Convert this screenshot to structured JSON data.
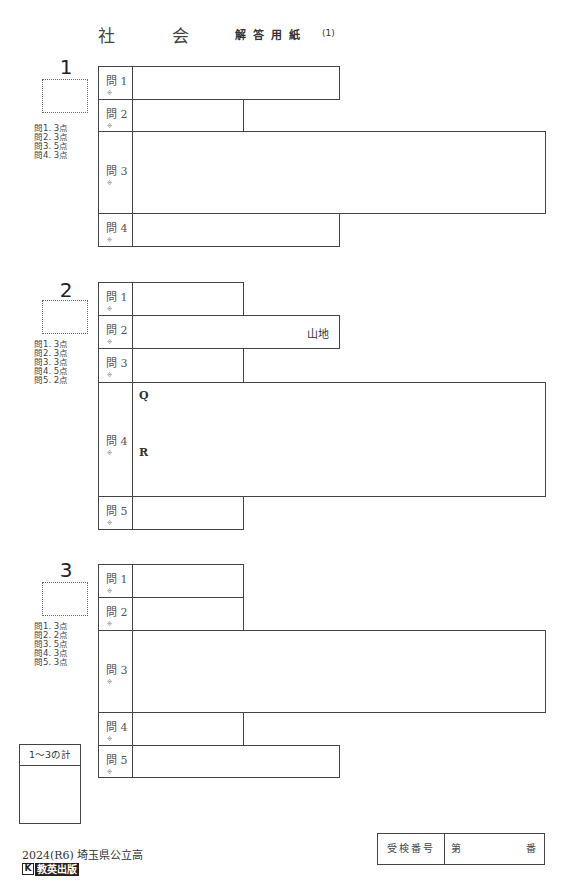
{
  "header": {
    "subject_1": "社",
    "subject_2": "会",
    "form_title": "解答用紙",
    "page": "(1)"
  },
  "sections": [
    {
      "number": "1",
      "points": "問1. 3点\n問2. 3点\n問3. 5点\n問4. 3点",
      "rows": [
        {
          "label": "問 1",
          "mark": "※"
        },
        {
          "label": "問 2",
          "mark": "※"
        },
        {
          "label": "問 3",
          "mark": "※"
        },
        {
          "label": "問 4",
          "mark": "※"
        }
      ]
    },
    {
      "number": "2",
      "points": "問1. 3点\n問2. 3点\n問3. 3点\n問4. 5点\n問5. 2点",
      "rows": [
        {
          "label": "問 1",
          "mark": "※"
        },
        {
          "label": "問 2",
          "mark": "※",
          "suffix": "山地"
        },
        {
          "label": "問 3",
          "mark": "※"
        },
        {
          "label": "問 4",
          "mark": "※",
          "sub_q": "Q",
          "sub_r": "R"
        },
        {
          "label": "問 5",
          "mark": "※"
        }
      ]
    },
    {
      "number": "3",
      "points": "問1. 3点\n問2. 2点\n問3. 5点\n問4. 3点\n問5. 3点",
      "rows": [
        {
          "label": "問 1",
          "mark": "※"
        },
        {
          "label": "問 2",
          "mark": "※"
        },
        {
          "label": "問 3",
          "mark": "※"
        },
        {
          "label": "問 4",
          "mark": "※"
        },
        {
          "label": "問 5",
          "mark": "※"
        }
      ]
    }
  ],
  "total": {
    "label": "1～3の計"
  },
  "footer": {
    "year_school": "2024(R6) 埼玉県公立高",
    "logo_k": "K",
    "logo_name": "教英出版"
  },
  "exam_number": {
    "label": "受検番号",
    "prefix": "第",
    "suffix": "番"
  }
}
